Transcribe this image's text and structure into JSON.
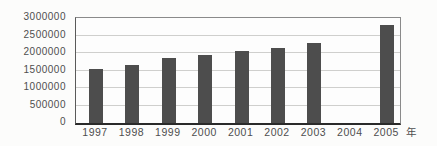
{
  "chart": {
    "background_color": "#fcfcfb",
    "bar_color": "#4d4d4d",
    "grid_color": "#cfcfcd",
    "axis_color": "#2a2a2a",
    "text_color": "#4e4e4e"
  },
  "chart_data": {
    "type": "bar",
    "categories": [
      "1997",
      "1998",
      "1999",
      "2000",
      "2001",
      "2002",
      "2003",
      "2004",
      "2005"
    ],
    "values": [
      1550000,
      1650000,
      1850000,
      1930000,
      2050000,
      2150000,
      2300000,
      0,
      2800000
    ],
    "title": "",
    "xlabel": "年",
    "ylabel": "",
    "ylim": [
      0,
      3000000
    ],
    "ytick_interval": 500000,
    "yticks": [
      "3000000",
      "2500000",
      "2000000",
      "1500000",
      "1000000",
      "500000",
      "0"
    ],
    "grid": true,
    "legend": false,
    "note": "no bar rendered for 2004"
  }
}
